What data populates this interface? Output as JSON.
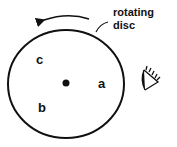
{
  "diagram": {
    "caption_line1": "rotating",
    "caption_line2": "disc",
    "points": [
      {
        "label": "c"
      },
      {
        "label": "a"
      },
      {
        "label": "b"
      }
    ],
    "icons": [
      "center-dot",
      "eye-icon",
      "rotation-arrow"
    ],
    "stroke_color": "#111111"
  }
}
